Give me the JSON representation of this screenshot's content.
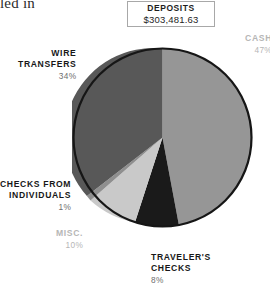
{
  "page_fragment": "led in",
  "callout": {
    "title": "DEPOSITS",
    "value": "$303,481.63"
  },
  "labels": {
    "cash": {
      "name": "CASH",
      "pct": "47%"
    },
    "wire": {
      "name": "WIRE\nTRANSFERS",
      "pct": "34%"
    },
    "checks": {
      "name": "CHECKS FROM\nINDIVIDUALS",
      "pct": "1%"
    },
    "misc": {
      "name": "MISC.",
      "pct": "10%"
    },
    "travelers": {
      "name": "TRAVELER'S\nCHECKS",
      "pct": "8%"
    }
  },
  "chart_data": {
    "type": "pie",
    "title": "DEPOSITS",
    "subtitle": "$303,481.63",
    "total_label": "$303,481.63",
    "total_value": 303481.63,
    "unit": "percent",
    "start_angle": 0,
    "direction": "clockwise",
    "legend": "labels-outside",
    "grid": false,
    "categories": [
      "CASH",
      "TRAVELER'S CHECKS",
      "MISC.",
      "CHECKS FROM INDIVIDUALS",
      "WIRE TRANSFERS"
    ],
    "values": [
      47,
      8,
      10,
      1,
      34
    ],
    "slices": [
      {
        "label": "CASH",
        "value": 47,
        "pct_label": "47%",
        "color": "#969696"
      },
      {
        "label": "TRAVELER'S CHECKS",
        "value": 8,
        "pct_label": "8%",
        "color": "#1a1a1a"
      },
      {
        "label": "MISC.",
        "value": 10,
        "pct_label": "10%",
        "color": "#c9c9c9"
      },
      {
        "label": "CHECKS FROM INDIVIDUALS",
        "value": 1,
        "pct_label": "1%",
        "color": "#8f8f8f"
      },
      {
        "label": "WIRE TRANSFERS",
        "value": 34,
        "pct_label": "34%",
        "color": "#585858"
      }
    ],
    "colors": {
      "outline": "#161616",
      "cash": "#969696",
      "travelers_checks": "#1a1a1a",
      "misc": "#c9c9c9",
      "checks_from_individuals": "#8f8f8f",
      "wire_transfers": "#585858",
      "label_dark": "#171717",
      "label_light": "#b6b6b6",
      "pct_text": "#6e6e6e",
      "box_border": "#a8a8a8",
      "background": "#ffffff"
    }
  }
}
